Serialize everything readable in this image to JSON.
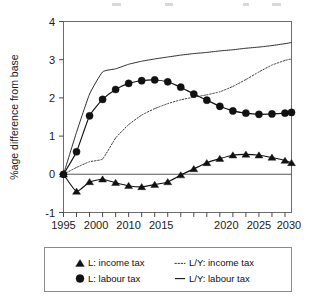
{
  "figure": {
    "background_color": "#ffffff",
    "ink_color": "#111111",
    "frame_color": "#6b6b6b"
  },
  "axes": {
    "y_title": "%age difference from base",
    "y_ticks": [
      "4",
      "3",
      "2",
      "1",
      "0",
      "-1"
    ],
    "y_min": -1,
    "y_max": 4,
    "x_ticks": [
      "1995",
      "2000",
      "2010",
      "2015",
      "2020",
      "2025",
      "2030"
    ],
    "x_tick_values": [
      1995,
      2000,
      2010,
      2015,
      2020,
      2025,
      2030
    ],
    "x_min": 1995,
    "x_max": 2030,
    "x_minor_step": 2,
    "zero_line": 0
  },
  "legend": {
    "entries": [
      {
        "label": "L: income tax",
        "marker": "triangle",
        "style": "solid-marker"
      },
      {
        "label": "L/Y: income tax",
        "marker": "none",
        "style": "dotted"
      },
      {
        "label": "L: labour tax",
        "marker": "circle",
        "style": "solid-marker"
      },
      {
        "label": "L/Y: labour tax",
        "marker": "none",
        "style": "solid"
      }
    ]
  },
  "chart_data": {
    "type": "line",
    "title": "",
    "subtitle": "",
    "xlabel": "",
    "ylabel": "%age difference from base",
    "xlim": [
      1995,
      2030
    ],
    "ylim": [
      -1,
      4
    ],
    "grid": false,
    "legend_position": "bottom",
    "x": [
      1995,
      1997,
      1999,
      2001,
      2003,
      2005,
      2007,
      2009,
      2011,
      2013,
      2015,
      2017,
      2019,
      2021,
      2023,
      2025,
      2027,
      2029,
      2030
    ],
    "series": [
      {
        "name": "L: income tax",
        "marker": "triangle",
        "style": "solid",
        "values": [
          0.0,
          -0.45,
          -0.2,
          -0.13,
          -0.22,
          -0.3,
          -0.33,
          -0.27,
          -0.2,
          -0.02,
          0.14,
          0.3,
          0.41,
          0.5,
          0.52,
          0.5,
          0.44,
          0.36,
          0.3
        ]
      },
      {
        "name": "L: labour tax",
        "marker": "circle",
        "style": "solid",
        "values": [
          0.0,
          0.59,
          1.53,
          1.96,
          2.22,
          2.38,
          2.45,
          2.47,
          2.42,
          2.28,
          2.1,
          1.94,
          1.78,
          1.66,
          1.6,
          1.57,
          1.58,
          1.6,
          1.62
        ]
      },
      {
        "name": "L/Y: income tax",
        "marker": "none",
        "style": "dotted",
        "values": [
          0.0,
          0.18,
          0.33,
          0.4,
          0.95,
          1.3,
          1.55,
          1.72,
          1.85,
          1.95,
          2.02,
          2.08,
          2.16,
          2.3,
          2.48,
          2.68,
          2.86,
          2.98,
          3.02
        ]
      },
      {
        "name": "L/Y: labour tax",
        "marker": "none",
        "style": "solid",
        "values": [
          0.0,
          1.1,
          2.1,
          2.68,
          2.76,
          2.88,
          2.96,
          3.02,
          3.07,
          3.12,
          3.16,
          3.19,
          3.23,
          3.26,
          3.3,
          3.33,
          3.37,
          3.42,
          3.45
        ]
      }
    ]
  }
}
